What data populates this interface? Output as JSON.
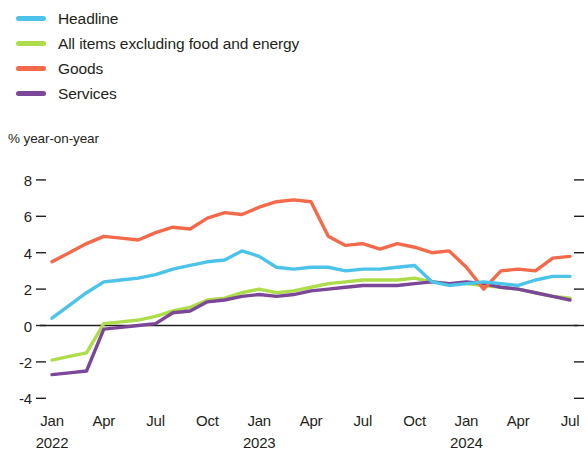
{
  "chart_data": {
    "type": "line",
    "title": "",
    "subtitle": "",
    "ylabel": "% year-on-year",
    "xlabel": "",
    "ylim": [
      -4,
      8
    ],
    "yticks": [
      8,
      6,
      4,
      2,
      0,
      -2,
      -4
    ],
    "ytick_labels": [
      "8",
      "6",
      "4",
      "2",
      "0",
      "-2",
      "-4"
    ],
    "grid": false,
    "zero_line": true,
    "legend_position": "top-left",
    "x_start": "2022-01",
    "x_end": "2024-07",
    "x": [
      "Jan 2022",
      "Feb 2022",
      "Mar 2022",
      "Apr 2022",
      "May 2022",
      "Jun 2022",
      "Jul 2022",
      "Aug 2022",
      "Sep 2022",
      "Oct 2022",
      "Nov 2022",
      "Dec 2022",
      "Jan 2023",
      "Feb 2023",
      "Mar 2023",
      "Apr 2023",
      "May 2023",
      "Jun 2023",
      "Jul 2023",
      "Aug 2023",
      "Sep 2023",
      "Oct 2023",
      "Nov 2023",
      "Dec 2023",
      "Jan 2024",
      "Feb 2024",
      "Mar 2024",
      "Apr 2024",
      "May 2024",
      "Jun 2024",
      "Jul 2024"
    ],
    "xticks": [
      {
        "index": 0,
        "label": "Jan",
        "year": "2022"
      },
      {
        "index": 3,
        "label": "Apr",
        "year": ""
      },
      {
        "index": 6,
        "label": "Jul",
        "year": ""
      },
      {
        "index": 9,
        "label": "Oct",
        "year": ""
      },
      {
        "index": 12,
        "label": "Jan",
        "year": "2023"
      },
      {
        "index": 15,
        "label": "Apr",
        "year": ""
      },
      {
        "index": 18,
        "label": "Jul",
        "year": ""
      },
      {
        "index": 21,
        "label": "Oct",
        "year": ""
      },
      {
        "index": 24,
        "label": "Jan",
        "year": "2024"
      },
      {
        "index": 27,
        "label": "Apr",
        "year": ""
      },
      {
        "index": 30,
        "label": "Jul",
        "year": ""
      }
    ],
    "series": [
      {
        "name": "Headline",
        "color": "#4CC3EA",
        "values": [
          0.4,
          1.1,
          1.8,
          2.4,
          2.5,
          2.6,
          2.8,
          3.1,
          3.3,
          3.5,
          3.6,
          4.1,
          3.8,
          3.2,
          3.1,
          3.2,
          3.2,
          3.0,
          3.1,
          3.1,
          3.2,
          3.3,
          2.4,
          2.2,
          2.3,
          2.4,
          2.3,
          2.2,
          2.5,
          2.7,
          2.7
        ]
      },
      {
        "name": "All items excluding food and energy",
        "color": "#AEDD4A",
        "values": [
          -1.9,
          -1.7,
          -1.5,
          0.1,
          0.2,
          0.3,
          0.5,
          0.8,
          1.0,
          1.4,
          1.5,
          1.8,
          2.0,
          1.8,
          1.9,
          2.1,
          2.3,
          2.4,
          2.5,
          2.5,
          2.5,
          2.6,
          2.4,
          2.3,
          2.3,
          2.2,
          2.1,
          2.0,
          1.8,
          1.6,
          1.5
        ]
      },
      {
        "name": "Goods",
        "color": "#F4694A",
        "values": [
          3.5,
          4.0,
          4.5,
          4.9,
          4.8,
          4.7,
          5.1,
          5.4,
          5.3,
          5.9,
          6.2,
          6.1,
          6.5,
          6.8,
          6.9,
          6.8,
          4.9,
          4.4,
          4.5,
          4.2,
          4.5,
          4.3,
          4.0,
          4.1,
          3.2,
          2.0,
          3.0,
          3.1,
          3.0,
          3.7,
          3.8
        ]
      },
      {
        "name": "Services",
        "color": "#7C4799",
        "values": [
          -2.7,
          -2.6,
          -2.5,
          -0.2,
          -0.1,
          0.0,
          0.1,
          0.7,
          0.8,
          1.3,
          1.4,
          1.6,
          1.7,
          1.6,
          1.7,
          1.9,
          2.0,
          2.1,
          2.2,
          2.2,
          2.2,
          2.3,
          2.4,
          2.3,
          2.4,
          2.3,
          2.1,
          2.0,
          1.8,
          1.6,
          1.4
        ]
      }
    ]
  },
  "legend": {
    "items": [
      {
        "label": "Headline",
        "color": "#4CC3EA"
      },
      {
        "label": "All items excluding food and energy",
        "color": "#AEDD4A"
      },
      {
        "label": "Goods",
        "color": "#F4694A"
      },
      {
        "label": "Services",
        "color": "#7C4799"
      }
    ]
  },
  "axis": {
    "unit_caption": "% year-on-year"
  }
}
